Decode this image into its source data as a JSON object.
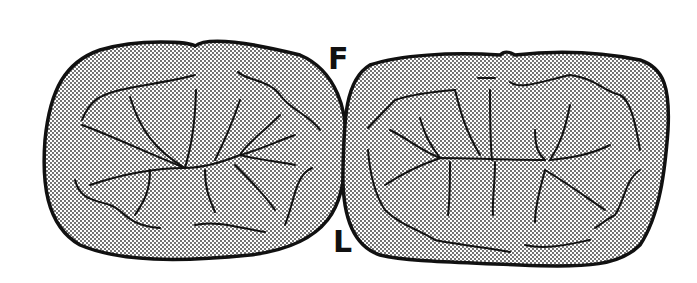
{
  "figure": {
    "labels": {
      "top": "F",
      "bottom": "L"
    },
    "teeth": [
      {
        "name": "left-tooth",
        "fill": "stippled"
      },
      {
        "name": "right-tooth",
        "fill": "stippled"
      }
    ],
    "colors": {
      "outline": "#111111",
      "background": "#ffffff",
      "dots": "#333333"
    }
  }
}
